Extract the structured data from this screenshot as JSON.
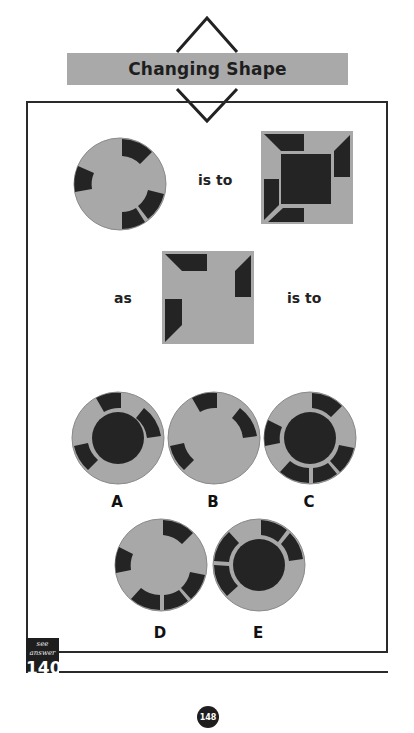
{
  "header": {
    "title": "Changing Shape"
  },
  "puzzle": {
    "connector_1": "is to",
    "connector_2": "as",
    "connector_3": "is to",
    "options": [
      {
        "label": "A"
      },
      {
        "label": "B"
      },
      {
        "label": "C"
      },
      {
        "label": "D"
      },
      {
        "label": "E"
      }
    ]
  },
  "footer": {
    "answer_caption": "see answer",
    "answer_number": "140",
    "page_number": "148"
  },
  "colors": {
    "shape_fill": "#a8a8a8",
    "segment_fill": "#242424",
    "title_bar": "#a9a9a9",
    "frame": "#2a2a2a"
  }
}
